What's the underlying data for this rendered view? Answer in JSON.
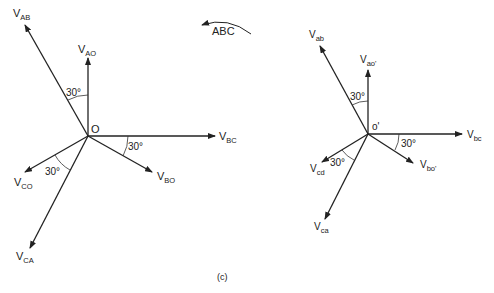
{
  "figure": {
    "caption": "(c)",
    "rotation_label": "ABC"
  },
  "left_diagram": {
    "origin_label": "O",
    "vectors": [
      {
        "name": "V_AB",
        "main": "V",
        "sub": "AB"
      },
      {
        "name": "V_AO",
        "main": "V",
        "sub": "AO"
      },
      {
        "name": "V_BC",
        "main": "V",
        "sub": "BC"
      },
      {
        "name": "V_BO",
        "main": "V",
        "sub": "BO"
      },
      {
        "name": "V_CO",
        "main": "V",
        "sub": "CO"
      },
      {
        "name": "V_CA",
        "main": "V",
        "sub": "CA"
      }
    ],
    "angles": [
      "30°",
      "30°",
      "30°"
    ]
  },
  "right_diagram": {
    "origin_label": "o'",
    "vectors": [
      {
        "name": "V_ab",
        "main": "V",
        "sub": "ab"
      },
      {
        "name": "V_ao'",
        "main": "V",
        "sub": "ao'"
      },
      {
        "name": "V_bc",
        "main": "V",
        "sub": "bc"
      },
      {
        "name": "V_bo'",
        "main": "V",
        "sub": "bo'"
      },
      {
        "name": "V_cd",
        "main": "V",
        "sub": "cd"
      },
      {
        "name": "V_ca",
        "main": "V",
        "sub": "ca"
      }
    ],
    "angles": [
      "30°",
      "30°",
      "30°"
    ]
  }
}
